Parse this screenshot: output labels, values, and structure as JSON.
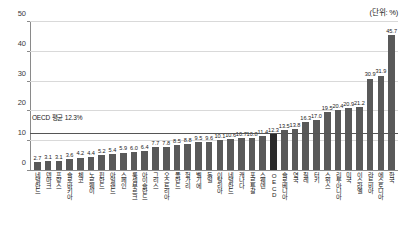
{
  "unit_note": "(단위: %)",
  "average": {
    "label": "OECD 평균 12.3%",
    "value": 12.3
  },
  "chart_data": {
    "type": "bar",
    "title": "",
    "subtitle": "",
    "xlabel": "",
    "ylabel": "",
    "unit": "%",
    "ylim": [
      0,
      50
    ],
    "yticks": [
      0,
      10,
      20,
      30,
      40,
      50
    ],
    "grid": true,
    "legend": false,
    "highlight_category": "OECD",
    "annotations": [
      "OECD 평균 12.3%",
      "(단위: %)"
    ],
    "categories": [
      "네덜란드",
      "덴마크",
      "프랑스",
      "슬로바키아",
      "체코",
      "노르웨이",
      "핀란드",
      "아일랜드",
      "스페인",
      "룩셈부르크",
      "아이슬란드",
      "그리스",
      "오스트리아",
      "폴란드",
      "헝가리",
      "벨기에",
      "독일",
      "이탈리아",
      "네덜란드",
      "캐나다",
      "포르투갈",
      "스웨덴",
      "OECD",
      "슬로베니아",
      "영국",
      "칠레",
      "터키",
      "스위스",
      "리투아니아",
      "미국",
      "이스라엘",
      "라트비아",
      "에스토니아",
      "한국"
    ],
    "values": [
      2.7,
      3.1,
      3.1,
      3.6,
      4.2,
      4.4,
      5.2,
      5.4,
      5.9,
      6.0,
      6.4,
      7.7,
      7.8,
      8.5,
      8.8,
      9.5,
      9.6,
      10.1,
      10.6,
      10.7,
      10.8,
      11.4,
      12.3,
      13.5,
      13.8,
      16.3,
      17.0,
      19.5,
      20.4,
      20.9,
      21.2,
      30.9,
      31.9,
      45.7
    ]
  }
}
